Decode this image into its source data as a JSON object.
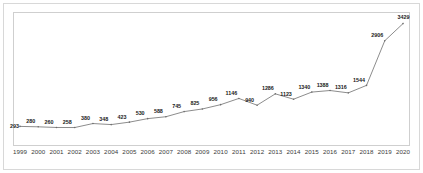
{
  "chart_data": {
    "type": "line",
    "title": "",
    "subtitle": "",
    "xlabel": "",
    "ylabel": "",
    "grid": false,
    "legend": "none",
    "axis": {
      "x_visible": true,
      "y_visible": false,
      "xlim": [
        "1999",
        "2020"
      ],
      "ylim": [
        0,
        3600
      ]
    },
    "categories": [
      "1999",
      "2000",
      "2001",
      "2002",
      "2003",
      "2004",
      "2005",
      "2006",
      "2007",
      "2008",
      "2009",
      "2010",
      "2011",
      "2012",
      "2013",
      "2014",
      "2015",
      "2016",
      "2017",
      "2018",
      "2019",
      "2020"
    ],
    "values": [
      293,
      280,
      260,
      258,
      380,
      348,
      423,
      530,
      588,
      745,
      825,
      956,
      1146,
      940,
      1286,
      1123,
      1340,
      1388,
      1316,
      1544,
      2906,
      3429
    ],
    "point_labels": [
      "293",
      "280",
      "260",
      "258",
      "380",
      "348",
      "423",
      "530",
      "588",
      "745",
      "825",
      "956",
      "1146",
      "940",
      "1286",
      "1123",
      "1340",
      "1388",
      "1316",
      "1544",
      "2906",
      "3429"
    ],
    "series": [
      {
        "name": "series-1",
        "values": [
          293,
          280,
          260,
          258,
          380,
          348,
          423,
          530,
          588,
          745,
          825,
          956,
          1146,
          940,
          1286,
          1123,
          1340,
          1388,
          1316,
          1544,
          2906,
          3429
        ]
      }
    ],
    "colors": {
      "line": "#6e6e6e",
      "marker": "#6e6e6e",
      "label_text": "#1a1a1a",
      "tick_text": "#3a3a3a",
      "plot_frame": "#cfcfcf",
      "outer_frame": "#d8d8d8",
      "background": "#ffffff"
    }
  }
}
